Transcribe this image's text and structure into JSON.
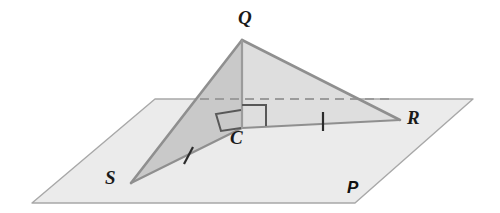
{
  "figure": {
    "type": "geometry-diagram",
    "background_color": "#ffffff"
  },
  "plane": {
    "name": "plane-p",
    "label": "P",
    "label_position": {
      "x": 347,
      "y": 179
    },
    "fill_color": "#ebebeb",
    "stroke_color": "#a8a8a8",
    "corners": [
      {
        "x": 155,
        "y": 99
      },
      {
        "x": 473,
        "y": 99
      },
      {
        "x": 355,
        "y": 203
      },
      {
        "x": 32,
        "y": 203
      }
    ]
  },
  "points": {
    "Q": {
      "label": "Q",
      "x": 242,
      "y": 40,
      "label_x": 238,
      "label_y": 8
    },
    "C": {
      "label": "C",
      "x": 242,
      "y": 128,
      "label_x": 230,
      "label_y": 128
    },
    "S": {
      "label": "S",
      "x": 131,
      "y": 183,
      "label_x": 105,
      "label_y": 168
    },
    "R": {
      "label": "R",
      "x": 400,
      "y": 120,
      "label_x": 407,
      "label_y": 108
    }
  },
  "triangles": [
    {
      "name": "triangle-qcs",
      "vertices": [
        "Q",
        "C",
        "S"
      ],
      "fill_color": "#c9c9c9",
      "stroke_color": "#8f8f8f"
    },
    {
      "name": "triangle-qcr",
      "vertices": [
        "Q",
        "C",
        "R"
      ],
      "fill_color": "#dedede",
      "stroke_color": "#8f8f8f"
    }
  ],
  "segments": [
    {
      "name": "segment-qc",
      "from": "Q",
      "to": "C",
      "style": "solid",
      "color": "#8f8f8f"
    },
    {
      "name": "segment-qs",
      "from": "Q",
      "to": "S",
      "style": "solid",
      "color": "#8f8f8f"
    },
    {
      "name": "segment-qr",
      "from": "Q",
      "to": "R",
      "style": "solid",
      "color": "#8f8f8f"
    },
    {
      "name": "segment-sc",
      "from": "S",
      "to": "C",
      "style": "solid",
      "color": "#8f8f8f"
    },
    {
      "name": "segment-cr",
      "from": "C",
      "to": "R",
      "style": "solid",
      "color": "#8f8f8f"
    }
  ],
  "dashed_line": {
    "name": "dashed-hidden-edge",
    "from": {
      "x": 200,
      "y": 99
    },
    "to": {
      "x": 393,
      "y": 99
    },
    "color": "#9b9b9b",
    "dash_pattern": "9 6"
  },
  "right_angle_marks": [
    {
      "name": "right-angle-qc-cr",
      "at": "C",
      "toward": "R",
      "color": "#555555"
    },
    {
      "name": "right-angle-qc-cs",
      "at": "C",
      "toward": "S",
      "color": "#555555"
    }
  ],
  "congruence_ticks": [
    {
      "name": "tick-sc",
      "on_segment": "SC",
      "x": 188,
      "y": 156,
      "color": "#2b2b2b"
    },
    {
      "name": "tick-cr",
      "on_segment": "CR",
      "x": 323,
      "y": 120,
      "color": "#2b2b2b"
    }
  ]
}
